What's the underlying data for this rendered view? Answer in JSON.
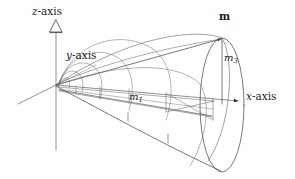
{
  "figure": {
    "type": "3d-line-diagram",
    "background_color": "#ffffff",
    "line_color": "#3a3a3a",
    "text_color": "#1a1a1a"
  },
  "axes": {
    "z": {
      "label": "z-axis",
      "italic_part": "z",
      "suffix": "-axis",
      "arrow": "hollow-triangle",
      "direction": "up"
    },
    "y": {
      "label": "y-axis",
      "italic_part": "y",
      "suffix": "-axis",
      "arrow": "none",
      "direction": "down-left"
    },
    "x": {
      "label": "x-axis",
      "italic_part": "x",
      "suffix": "-axis",
      "arrow": "filled-triangle",
      "direction": "right"
    }
  },
  "annotations": {
    "vector": {
      "label": "m",
      "style": "bold"
    },
    "m1": {
      "label": "m",
      "subscript": "1"
    },
    "m3": {
      "label": "m",
      "subscript": "3"
    }
  },
  "geometry": {
    "origin": [
      56,
      85
    ],
    "apex_point": [
      222,
      38
    ],
    "base_ellipse": {
      "cx": 222,
      "cy": 105,
      "rx": 22,
      "ry": 67
    },
    "arc_count": 5
  }
}
